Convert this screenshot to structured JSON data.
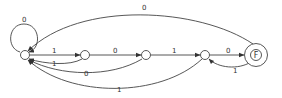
{
  "diagram": {
    "type": "finite-state-automaton",
    "nodes": [
      {
        "id": "s0",
        "label": ""
      },
      {
        "id": "s1",
        "label": ""
      },
      {
        "id": "s2",
        "label": ""
      },
      {
        "id": "s3",
        "label": ""
      },
      {
        "id": "F",
        "label": "F",
        "accepting": true
      }
    ],
    "edges": [
      {
        "from": "s0",
        "to": "s0",
        "label": "0"
      },
      {
        "from": "s0",
        "to": "s1",
        "label": "1"
      },
      {
        "from": "s1",
        "to": "s0",
        "label": "1"
      },
      {
        "from": "s1",
        "to": "s2",
        "label": "0"
      },
      {
        "from": "s2",
        "to": "s0",
        "label": "0"
      },
      {
        "from": "s2",
        "to": "s3",
        "label": "1"
      },
      {
        "from": "s3",
        "to": "s0",
        "label": "1"
      },
      {
        "from": "s3",
        "to": "F",
        "label": "0"
      },
      {
        "from": "F",
        "to": "s3",
        "label": "1"
      },
      {
        "from": "F",
        "to": "s0",
        "label": "0"
      }
    ]
  }
}
